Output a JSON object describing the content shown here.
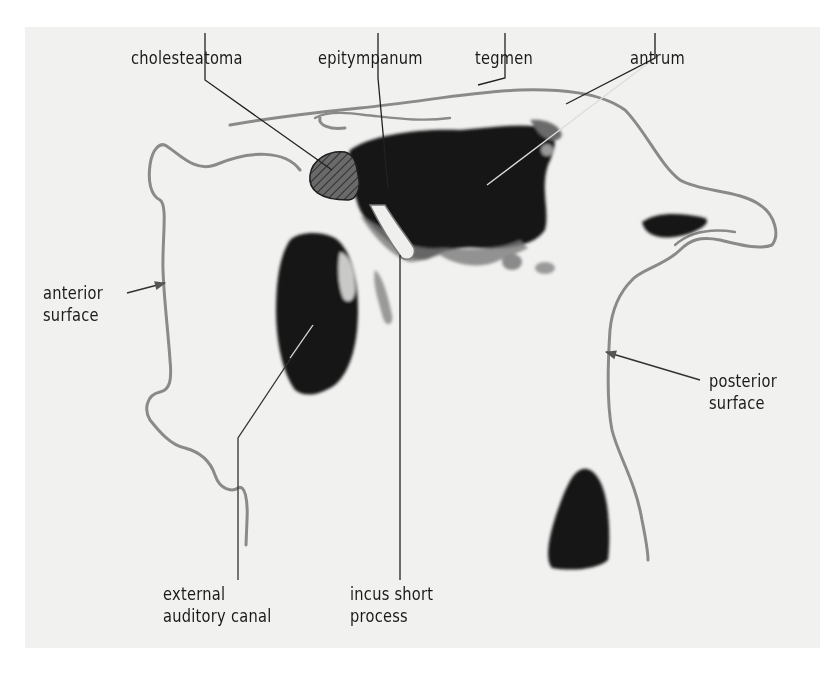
{
  "figure": {
    "colors": {
      "background": "#ffffff",
      "panel": "#f1f1ef",
      "bone_outline": "#8a8a8a",
      "cavity": "#141414",
      "leader_line": "#222222",
      "text": "#1a1a1a"
    }
  },
  "labels": {
    "cholesteatoma": "cholesteatoma",
    "epitympanum": "epitympanum",
    "tegmen": "tegmen",
    "antrum": "antrum",
    "anterior_surface": [
      "anterior",
      "surface"
    ],
    "posterior_surface": [
      "posterior",
      "surface"
    ],
    "external_auditory_canal": [
      "external",
      "auditory canal"
    ],
    "incus_short_process": [
      "incus short",
      "process"
    ]
  }
}
